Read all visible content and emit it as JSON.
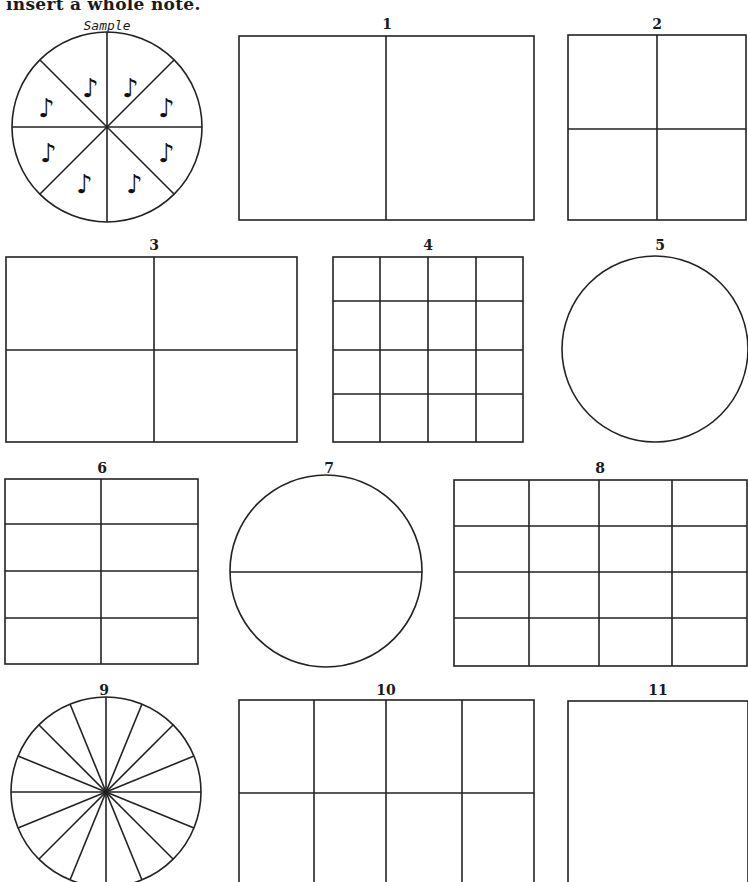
{
  "header": {
    "instructions_text": "insert a whole note."
  },
  "sample": {
    "label": "Sample",
    "shape": "circle",
    "divisions": 8,
    "note_icon": "eighth-note-icon",
    "note_glyph": "♪"
  },
  "exercises": [
    {
      "number": "1",
      "shape": "rectangle",
      "grid": "2 columns x 1 row"
    },
    {
      "number": "2",
      "shape": "rectangle",
      "grid": "2 columns x 2 rows"
    },
    {
      "number": "3",
      "shape": "rectangle",
      "grid": "2 columns x 2 rows"
    },
    {
      "number": "4",
      "shape": "rectangle",
      "grid": "4 columns x 4 rows"
    },
    {
      "number": "5",
      "shape": "circle",
      "grid": "undivided"
    },
    {
      "number": "6",
      "shape": "rectangle",
      "grid": "2 columns x 4 rows"
    },
    {
      "number": "7",
      "shape": "circle",
      "grid": "halved horizontally"
    },
    {
      "number": "8",
      "shape": "rectangle",
      "grid": "4 columns x 4 rows"
    },
    {
      "number": "9",
      "shape": "circle",
      "grid": "16 slices"
    },
    {
      "number": "10",
      "shape": "rectangle",
      "grid": "4 columns x 2 rows"
    },
    {
      "number": "11",
      "shape": "rectangle",
      "grid": "undivided"
    }
  ]
}
